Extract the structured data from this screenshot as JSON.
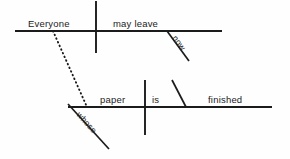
{
  "diagram": {
    "type": "reed-kellogg-sentence-diagram",
    "canvas": {
      "width": 290,
      "height": 159,
      "background": "#fefefe"
    },
    "ink_color": "#1b1b1b",
    "sentence": "Everyone may leave now whose paper is finished",
    "clauses": [
      {
        "name": "main-clause",
        "baseline": {
          "x1": 15,
          "y1": 31,
          "x2": 222,
          "y2": 31
        },
        "subject_predicate_divider": {
          "x": 96,
          "y1": 1,
          "y2": 53
        },
        "words": [
          {
            "role": "subject",
            "text": "Everyone",
            "x": 28,
            "y": 27
          },
          {
            "role": "verb",
            "text": "may  leave",
            "x": 113,
            "y": 27
          }
        ],
        "modifiers": [
          {
            "role": "adverb",
            "text": "now",
            "line": {
              "x1": 167,
              "y1": 31,
              "x2": 189,
              "y2": 61
            },
            "label_x": 172,
            "label_y": 38,
            "rotation": 54
          }
        ]
      },
      {
        "name": "relative-clause",
        "baseline": {
          "x1": 68,
          "y1": 107,
          "x2": 272,
          "y2": 107
        },
        "subject_predicate_divider": {
          "x": 145,
          "y1": 80,
          "y2": 135
        },
        "words": [
          {
            "role": "subject",
            "text": "paper",
            "x": 100,
            "y": 103
          },
          {
            "role": "linking-verb",
            "text": "is",
            "x": 152,
            "y": 103
          },
          {
            "role": "predicate-adjective",
            "text": "finished",
            "x": 208,
            "y": 103
          }
        ],
        "predicate_slant": {
          "x1": 172,
          "y1": 80,
          "x2": 186,
          "y2": 107
        },
        "modifiers": [
          {
            "role": "relative-pronoun-possessive",
            "text": "whose",
            "line": {
              "x1": 68,
              "y1": 104,
              "x2": 109,
              "y2": 149
            },
            "label_x": 76,
            "label_y": 115,
            "rotation": 48
          }
        ]
      }
    ],
    "connector": {
      "name": "relative-clause-connector",
      "style": "dotted",
      "from": {
        "x": 53,
        "y": 31
      },
      "to": {
        "x": 87,
        "y": 107
      }
    }
  }
}
